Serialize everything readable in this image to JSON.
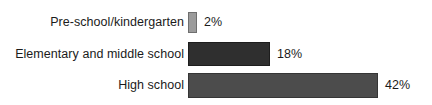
{
  "chart_data": {
    "type": "bar",
    "orientation": "horizontal",
    "title": "",
    "subtitle": "",
    "xlabel": "",
    "ylabel": "",
    "grid": false,
    "legend": "none",
    "xlim": [
      0,
      45
    ],
    "categories": [
      "Pre-school/kindergarten",
      "Elementary and middle school",
      "High school"
    ],
    "values": [
      2,
      18,
      42
    ],
    "value_labels": [
      "2%",
      "18%",
      "42%"
    ],
    "value_unit": "%",
    "bar_colors": [
      "#9b9b9b",
      "#2f2f2f",
      "#4c4c4c"
    ],
    "bar_border_colors": [
      "#6f6f6f",
      "#1d1d1d",
      "#353535"
    ],
    "background_color": "#ffffff",
    "text_color": "#1b1b1b"
  },
  "rows": [
    {
      "label": "Pre-school/kindergarten",
      "value_label": "2%"
    },
    {
      "label": "Elementary and middle school",
      "value_label": "18%"
    },
    {
      "label": "High school",
      "value_label": "42%"
    }
  ]
}
